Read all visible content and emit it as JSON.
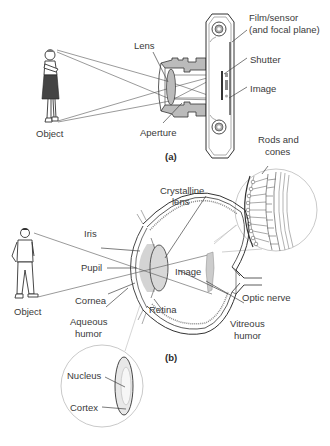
{
  "panel_a": {
    "caption": "(a)",
    "labels": {
      "film_sensor_1": "Film/sensor",
      "film_sensor_2": "(and focal plane)",
      "lens": "Lens",
      "shutter": "Shutter",
      "image": "Image",
      "object": "Object",
      "aperture": "Aperture"
    }
  },
  "panel_b": {
    "caption": "(b)",
    "labels": {
      "rods_cones_1": "Rods and",
      "rods_cones_2": "cones",
      "crystalline_lens_1": "Crystalline",
      "crystalline_lens_2": "lens",
      "iris": "Iris",
      "pupil": "Pupil",
      "image": "Image",
      "cornea": "Cornea",
      "object": "Object",
      "optic_nerve": "Optic nerve",
      "aqueous_humor_1": "Aqueous",
      "aqueous_humor_2": "humor",
      "retina": "Retina",
      "vitreous_humor_1": "Vitreous",
      "vitreous_humor_2": "humor",
      "nucleus": "Nucleus",
      "cortex": "Cortex"
    }
  },
  "colors": {
    "line": "#444444",
    "fill_gray": "#c8c8c8",
    "text": "#3a3a3a"
  }
}
